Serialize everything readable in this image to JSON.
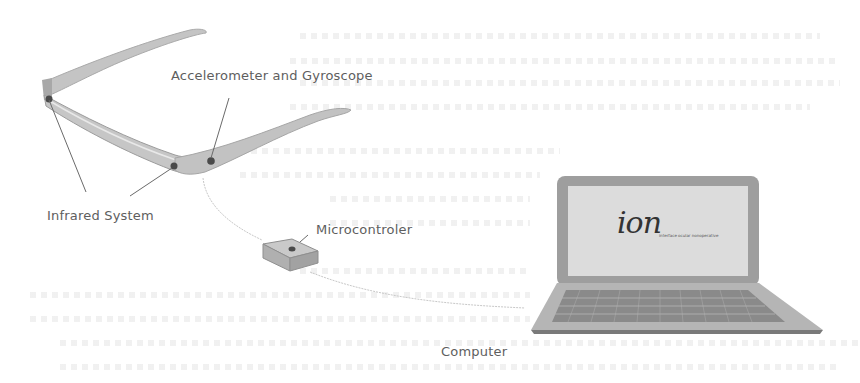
{
  "diagram": {
    "type": "system-architecture",
    "components": [
      {
        "id": "glasses",
        "name": "Eyeglasses frame with sensors"
      },
      {
        "id": "microcontroller",
        "name": "Microcontroler"
      },
      {
        "id": "computer",
        "name": "Computer"
      }
    ],
    "connections": [
      {
        "from": "glasses",
        "to": "microcontroller",
        "style": "thin cable"
      },
      {
        "from": "microcontroller",
        "to": "computer",
        "style": "thin cable"
      }
    ]
  },
  "labels": {
    "accelerometer": "Accelerometer and Gyroscope",
    "infrared": "Infrared System",
    "microcontroller": "Microcontroler",
    "computer": "Computer"
  },
  "screen": {
    "logo": "ion",
    "logo_subtitle": "interface ocular nonoperative"
  },
  "colors": {
    "background": "#ffffff",
    "device_gray": "#b9b9b9",
    "device_dark": "#8f8f8f",
    "sensor_dot": "#4a4a4a",
    "label_text": "#5e5e5e",
    "leader_line": "#6a6a6a"
  }
}
